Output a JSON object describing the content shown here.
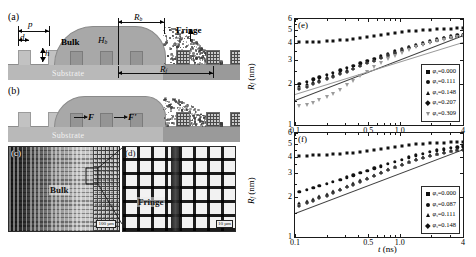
{
  "figure": {
    "panels": {
      "a": "(a)",
      "b": "(b)",
      "c": "(c)",
      "d": "(d)",
      "e": "(e)",
      "f": "(f)"
    }
  },
  "schematic": {
    "substrate_label": "Substrate",
    "bulk_label": "Bulk",
    "fringe_label": "Fringe",
    "dims": {
      "pitch": "p",
      "diameter": "d",
      "height": "h",
      "bulk_radius": "R",
      "bulk_radius_sub": "b",
      "bulk_height": "H",
      "bulk_height_sub": "b",
      "fringe_radius": "R",
      "fringe_radius_sub": "f"
    },
    "forces": {
      "f1": "F",
      "f2": "F'"
    }
  },
  "micrographs": {
    "c": {
      "tag": "(c)",
      "region_label": "Bulk",
      "scale_bar": "100 µm"
    },
    "d": {
      "tag": "(d)",
      "region_label": "Fringe",
      "scale_bar": "10 µm"
    }
  },
  "chart_data": [
    {
      "type": "scatter",
      "panel": "(e)",
      "title": "",
      "xlabel": "t (ns)",
      "ylabel": "R_f (nm)",
      "xscale": "log",
      "yscale": "log",
      "xlim": [
        0.1,
        4
      ],
      "ylim": [
        1,
        6
      ],
      "xticks": [
        0.1,
        0.5,
        1.0,
        4
      ],
      "xticklabels": [
        "0.1",
        "0.5",
        "1.0",
        "4"
      ],
      "yticks": [
        1,
        2,
        3,
        4,
        5,
        6
      ],
      "yticklabels": [
        "1",
        "2",
        "3",
        "4",
        "5",
        "6"
      ],
      "grid": false,
      "legend_position": "lower-right",
      "series": [
        {
          "name": "φs=0.000",
          "marker": "square",
          "x": [
            0.11,
            0.13,
            0.15,
            0.17,
            0.2,
            0.23,
            0.27,
            0.31,
            0.36,
            0.42,
            0.49,
            0.57,
            0.66,
            0.77,
            0.9,
            1.05,
            1.22,
            1.42,
            1.65,
            1.92,
            2.24,
            2.61,
            3.04,
            3.54,
            4.0
          ],
          "y": [
            4.05,
            4.06,
            4.08,
            4.1,
            4.12,
            4.15,
            4.18,
            4.22,
            4.27,
            4.33,
            4.4,
            4.47,
            4.55,
            4.63,
            4.71,
            4.79,
            4.86,
            4.92,
            4.97,
            5.01,
            5.05,
            5.08,
            5.1,
            5.12,
            5.13
          ]
        },
        {
          "name": "φs=0.111",
          "marker": "circle",
          "x": [
            0.11,
            0.13,
            0.15,
            0.17,
            0.2,
            0.23,
            0.27,
            0.31,
            0.36,
            0.42,
            0.49,
            0.57,
            0.66,
            0.77,
            0.9,
            1.05,
            1.22,
            1.42,
            1.65,
            1.92,
            2.24,
            2.61,
            3.04,
            3.54,
            4.0
          ],
          "y": [
            2.0,
            2.08,
            2.16,
            2.24,
            2.33,
            2.42,
            2.52,
            2.62,
            2.72,
            2.83,
            2.95,
            3.07,
            3.2,
            3.33,
            3.47,
            3.61,
            3.75,
            3.89,
            4.02,
            4.15,
            4.27,
            4.38,
            4.47,
            4.55,
            4.61
          ]
        },
        {
          "name": "φs=0.148",
          "marker": "triangle",
          "x": [
            0.11,
            0.13,
            0.15,
            0.17,
            0.2,
            0.23,
            0.27,
            0.31,
            0.36,
            0.42,
            0.49,
            0.57,
            0.66,
            0.77,
            0.9,
            1.05,
            1.22,
            1.42,
            1.65,
            1.92,
            2.24,
            2.61,
            3.04,
            3.54,
            4.0
          ],
          "y": [
            1.92,
            1.99,
            2.07,
            2.15,
            2.24,
            2.33,
            2.43,
            2.53,
            2.64,
            2.76,
            2.88,
            3.01,
            3.14,
            3.28,
            3.42,
            3.57,
            3.71,
            3.85,
            3.99,
            4.12,
            4.24,
            4.35,
            4.44,
            4.52,
            4.58
          ]
        },
        {
          "name": "φs=0.207",
          "marker": "diamond",
          "x": [
            0.11,
            0.13,
            0.15,
            0.17,
            0.2,
            0.23,
            0.27,
            0.31,
            0.36,
            0.42,
            0.49,
            0.57,
            0.66,
            0.77,
            0.9,
            1.05,
            1.22,
            1.42,
            1.65,
            1.92,
            2.24,
            2.61,
            3.04,
            3.54,
            4.0
          ],
          "y": [
            1.84,
            1.91,
            1.99,
            2.07,
            2.16,
            2.26,
            2.36,
            2.47,
            2.58,
            2.7,
            2.83,
            2.96,
            3.1,
            3.24,
            3.39,
            3.54,
            3.68,
            3.83,
            3.96,
            4.09,
            4.21,
            4.32,
            4.41,
            4.49,
            4.55
          ]
        },
        {
          "name": "φs=0.309",
          "marker": "down-triangle",
          "x": [
            0.11,
            0.13,
            0.15,
            0.17,
            0.2,
            0.23,
            0.27,
            0.31,
            0.36,
            0.42,
            0.49,
            0.57,
            0.66,
            0.77,
            0.9,
            1.05,
            1.22,
            1.42,
            1.65,
            1.92,
            2.24,
            2.61,
            3.04,
            3.54,
            4.0
          ],
          "y": [
            1.38,
            1.41,
            1.46,
            1.52,
            1.6,
            1.7,
            1.82,
            1.96,
            2.11,
            2.28,
            2.46,
            2.65,
            2.84,
            3.03,
            3.22,
            3.4,
            3.57,
            3.73,
            3.88,
            4.01,
            4.13,
            4.24,
            4.33,
            4.41,
            4.48
          ]
        }
      ],
      "fit_lines": [
        {
          "name": "power-law fit lower",
          "x": [
            0.1,
            4.0
          ],
          "y": [
            1.52,
            4.55
          ]
        },
        {
          "name": "power-law fit upper",
          "x": [
            0.1,
            4.0
          ],
          "y": [
            1.7,
            4.1
          ]
        }
      ]
    },
    {
      "type": "scatter",
      "panel": "(f)",
      "title": "",
      "xlabel": "t (ns)",
      "ylabel": "R_f (nm)",
      "xscale": "log",
      "yscale": "log",
      "xlim": [
        0.1,
        4
      ],
      "ylim": [
        1,
        6
      ],
      "xticks": [
        0.1,
        0.5,
        1.0,
        4
      ],
      "xticklabels": [
        "0.1",
        "0.5",
        "1.0",
        "4"
      ],
      "yticks": [
        1,
        2,
        3,
        4,
        5,
        6
      ],
      "yticklabels": [
        "1",
        "2",
        "3",
        "4",
        "5",
        "6"
      ],
      "grid": false,
      "legend_position": "lower-right",
      "series": [
        {
          "name": "φs=0.000",
          "marker": "square",
          "x": [
            0.11,
            0.13,
            0.15,
            0.17,
            0.2,
            0.23,
            0.27,
            0.31,
            0.36,
            0.42,
            0.49,
            0.57,
            0.66,
            0.77,
            0.9,
            1.05,
            1.22,
            1.42,
            1.65,
            1.92,
            2.24,
            2.61,
            3.04,
            3.54,
            4.0
          ],
          "y": [
            4.06,
            4.07,
            4.09,
            4.11,
            4.13,
            4.16,
            4.19,
            4.23,
            4.28,
            4.34,
            4.41,
            4.48,
            4.56,
            4.64,
            4.72,
            4.8,
            4.87,
            4.93,
            4.98,
            5.02,
            5.06,
            5.09,
            5.11,
            5.13,
            5.14
          ]
        },
        {
          "name": "φs=0.087",
          "marker": "circle",
          "x": [
            0.11,
            0.13,
            0.15,
            0.17,
            0.2,
            0.23,
            0.27,
            0.31,
            0.36,
            0.42,
            0.49,
            0.57,
            0.66,
            0.77,
            0.9,
            1.05,
            1.22,
            1.42,
            1.65,
            1.92,
            2.24,
            2.61,
            3.04,
            3.54,
            4.0
          ],
          "y": [
            2.18,
            2.25,
            2.33,
            2.41,
            2.5,
            2.59,
            2.69,
            2.79,
            2.9,
            3.01,
            3.13,
            3.26,
            3.39,
            3.52,
            3.66,
            3.8,
            3.94,
            4.08,
            4.21,
            4.33,
            4.44,
            4.54,
            4.63,
            4.7,
            4.76
          ]
        },
        {
          "name": "φs=0.111",
          "marker": "triangle",
          "x": [
            0.11,
            0.13,
            0.15,
            0.17,
            0.2,
            0.23,
            0.27,
            0.31,
            0.36,
            0.42,
            0.49,
            0.57,
            0.66,
            0.77,
            0.9,
            1.05,
            1.22,
            1.42,
            1.65,
            1.92,
            2.24,
            2.61,
            3.04,
            3.54,
            4.0
          ],
          "y": [
            1.8,
            1.87,
            1.94,
            2.02,
            2.11,
            2.2,
            2.3,
            2.41,
            2.53,
            2.65,
            2.78,
            2.92,
            3.06,
            3.21,
            3.36,
            3.51,
            3.66,
            3.81,
            3.95,
            4.08,
            4.2,
            4.31,
            4.4,
            4.48,
            4.54
          ]
        },
        {
          "name": "φs=0.148",
          "marker": "diamond",
          "x": [
            0.11,
            0.13,
            0.15,
            0.17,
            0.2,
            0.23,
            0.27,
            0.31,
            0.36,
            0.42,
            0.49,
            0.57,
            0.66,
            0.77,
            0.9,
            1.05,
            1.22,
            1.42,
            1.65,
            1.92,
            2.24,
            2.61,
            3.04,
            3.54,
            4.0
          ],
          "y": [
            1.72,
            1.79,
            1.87,
            1.95,
            2.04,
            2.13,
            2.24,
            2.35,
            2.47,
            2.6,
            2.73,
            2.87,
            3.02,
            3.17,
            3.32,
            3.47,
            3.62,
            3.77,
            3.91,
            4.04,
            4.16,
            4.27,
            4.37,
            4.45,
            4.51
          ]
        }
      ],
      "fit_lines": [
        {
          "name": "power-law fit",
          "x": [
            0.1,
            4.0
          ],
          "y": [
            1.5,
            4.5
          ]
        }
      ]
    }
  ],
  "legends": {
    "e": [
      {
        "marker": "square",
        "label": "φ",
        "sub": "s",
        "value": "=0.000"
      },
      {
        "marker": "circle",
        "label": "φ",
        "sub": "s",
        "value": "=0.111"
      },
      {
        "marker": "triangle",
        "label": "φ",
        "sub": "s",
        "value": "=0.148"
      },
      {
        "marker": "diamond",
        "label": "φ",
        "sub": "s",
        "value": "=0.207"
      },
      {
        "marker": "down-triangle",
        "label": "φ",
        "sub": "s",
        "value": "=0.309"
      }
    ],
    "f": [
      {
        "marker": "square",
        "label": "φ",
        "sub": "s",
        "value": "=0.000"
      },
      {
        "marker": "circle",
        "label": "φ",
        "sub": "s",
        "value": "=0.087"
      },
      {
        "marker": "triangle",
        "label": "φ",
        "sub": "s",
        "value": "=0.111"
      },
      {
        "marker": "diamond",
        "label": "φ",
        "sub": "s",
        "value": "=0.148"
      }
    ]
  }
}
